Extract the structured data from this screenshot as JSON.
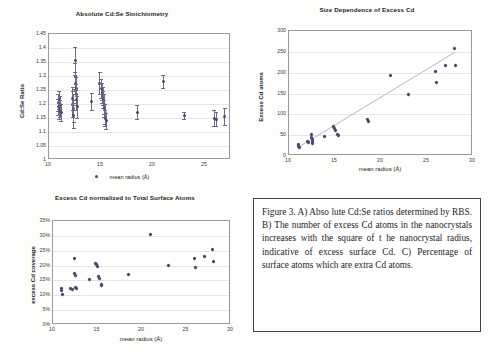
{
  "figure": {
    "caption": "Figure 3.   A) Abso lute Cd:Se ratios determined by RBS. B) The number of excess Cd atoms in the nanocrystals increases with the square of t he nanocrystal radius, indicative of excess surface Cd.  C) Percentage of surface atoms which are extra Cd atoms."
  },
  "chart_data": [
    {
      "id": "panel-a",
      "type": "scatter",
      "title": "Absolute Cd:Se Stoichiometry",
      "xlabel": "mean radius (Å)",
      "ylabel": "Cd:Se Ratio",
      "xlim": [
        10,
        27.5
      ],
      "ylim": [
        1,
        1.45
      ],
      "xticks": [
        10,
        15,
        20,
        25
      ],
      "yticks": [
        "1",
        "1.05",
        "1.1",
        "1.15",
        "1.2",
        "1.25",
        "1.3",
        "1.35",
        "1.4",
        "1.45"
      ],
      "grid": true,
      "legend": "mean radius (Å)",
      "legend_position": "bottom",
      "points": [
        {
          "x": 10.9,
          "y": 1.205,
          "err": 0.03
        },
        {
          "x": 10.9,
          "y": 1.19,
          "err": 0.028
        },
        {
          "x": 11.0,
          "y": 1.175,
          "err": 0.03
        },
        {
          "x": 11.0,
          "y": 1.215,
          "err": 0.032
        },
        {
          "x": 11.1,
          "y": 1.185,
          "err": 0.03
        },
        {
          "x": 11.1,
          "y": 1.2,
          "err": 0.028
        },
        {
          "x": 11.2,
          "y": 1.17,
          "err": 0.03
        },
        {
          "x": 12.3,
          "y": 1.2,
          "err": 0.045
        },
        {
          "x": 12.3,
          "y": 1.22,
          "err": 0.04
        },
        {
          "x": 12.4,
          "y": 1.185,
          "err": 0.05
        },
        {
          "x": 12.4,
          "y": 1.16,
          "err": 0.045
        },
        {
          "x": 12.5,
          "y": 1.355,
          "err": 0.05
        },
        {
          "x": 12.5,
          "y": 1.3,
          "err": 0.045
        },
        {
          "x": 12.5,
          "y": 1.275,
          "err": 0.04
        },
        {
          "x": 12.6,
          "y": 1.255,
          "err": 0.04
        },
        {
          "x": 12.6,
          "y": 1.235,
          "err": 0.038
        },
        {
          "x": 12.6,
          "y": 1.215,
          "err": 0.035
        },
        {
          "x": 12.7,
          "y": 1.19,
          "err": 0.04
        },
        {
          "x": 14.1,
          "y": 1.21,
          "err": 0.03
        },
        {
          "x": 14.9,
          "y": 1.275,
          "err": 0.04
        },
        {
          "x": 15.0,
          "y": 1.255,
          "err": 0.035
        },
        {
          "x": 15.1,
          "y": 1.24,
          "err": 0.035
        },
        {
          "x": 15.1,
          "y": 1.245,
          "err": 0.03
        },
        {
          "x": 15.2,
          "y": 1.23,
          "err": 0.032
        },
        {
          "x": 15.2,
          "y": 1.215,
          "err": 0.03
        },
        {
          "x": 15.3,
          "y": 1.2,
          "err": 0.035
        },
        {
          "x": 15.3,
          "y": 1.185,
          "err": 0.03
        },
        {
          "x": 15.4,
          "y": 1.165,
          "err": 0.035
        },
        {
          "x": 15.4,
          "y": 1.15,
          "err": 0.03
        },
        {
          "x": 15.5,
          "y": 1.14,
          "err": 0.028
        },
        {
          "x": 18.5,
          "y": 1.17,
          "err": 0.025
        },
        {
          "x": 21.0,
          "y": 1.28,
          "err": 0.022
        },
        {
          "x": 23.0,
          "y": 1.16,
          "err": 0.012
        },
        {
          "x": 25.9,
          "y": 1.15,
          "err": 0.028
        },
        {
          "x": 26.1,
          "y": 1.145,
          "err": 0.025
        },
        {
          "x": 26.9,
          "y": 1.155,
          "err": 0.03
        },
        {
          "x": 27.8,
          "y": 1.15,
          "err": 0.032
        }
      ]
    },
    {
      "id": "panel-b",
      "type": "scatter",
      "title": "Size Dependence of Excess Cd",
      "xlabel": "mean radius (Å)",
      "ylabel": "Excess Cd atoms",
      "xlim": [
        10,
        30
      ],
      "ylim": [
        0,
        300
      ],
      "xticks": [
        10,
        15,
        20,
        25,
        30
      ],
      "yticks": [
        0,
        50,
        100,
        150,
        200,
        250,
        300
      ],
      "grid": true,
      "trendline": {
        "x0": 11.0,
        "y0": 22,
        "x1": 28.0,
        "y1": 250
      },
      "points": [
        {
          "x": 11.0,
          "y": 28
        },
        {
          "x": 11.0,
          "y": 22
        },
        {
          "x": 11.1,
          "y": 20
        },
        {
          "x": 12.0,
          "y": 35
        },
        {
          "x": 12.1,
          "y": 32
        },
        {
          "x": 12.4,
          "y": 52
        },
        {
          "x": 12.4,
          "y": 45
        },
        {
          "x": 12.5,
          "y": 40
        },
        {
          "x": 12.5,
          "y": 36
        },
        {
          "x": 12.6,
          "y": 31
        },
        {
          "x": 13.9,
          "y": 48
        },
        {
          "x": 14.8,
          "y": 70
        },
        {
          "x": 14.9,
          "y": 66
        },
        {
          "x": 15.0,
          "y": 62
        },
        {
          "x": 15.3,
          "y": 52
        },
        {
          "x": 15.4,
          "y": 49
        },
        {
          "x": 18.5,
          "y": 88
        },
        {
          "x": 18.6,
          "y": 84
        },
        {
          "x": 21.0,
          "y": 193
        },
        {
          "x": 23.0,
          "y": 148
        },
        {
          "x": 25.9,
          "y": 202
        },
        {
          "x": 26.0,
          "y": 176
        },
        {
          "x": 27.0,
          "y": 218
        },
        {
          "x": 28.0,
          "y": 257
        },
        {
          "x": 28.1,
          "y": 217
        }
      ]
    },
    {
      "id": "panel-c",
      "type": "scatter",
      "title": "Excess Cd normalized to Total Surface Atoms",
      "xlabel": "mean radius (Å)",
      "ylabel": "excess Cd  coverage",
      "xlim": [
        10,
        30
      ],
      "ylim": [
        0,
        35
      ],
      "xticks": [
        10,
        15,
        20,
        25,
        30
      ],
      "yticks": [
        "0%",
        "5%",
        "10%",
        "15%",
        "20%",
        "25%",
        "30%",
        "35%"
      ],
      "grid": true,
      "points": [
        {
          "x": 11.0,
          "y": 12.4
        },
        {
          "x": 11.0,
          "y": 11.6
        },
        {
          "x": 11.1,
          "y": 10.2
        },
        {
          "x": 12.0,
          "y": 12.3
        },
        {
          "x": 12.2,
          "y": 11.9
        },
        {
          "x": 12.4,
          "y": 22.5
        },
        {
          "x": 12.4,
          "y": 17.3
        },
        {
          "x": 12.5,
          "y": 16.6
        },
        {
          "x": 12.5,
          "y": 12.6
        },
        {
          "x": 12.6,
          "y": 12.2
        },
        {
          "x": 14.1,
          "y": 15.2
        },
        {
          "x": 14.8,
          "y": 20.6
        },
        {
          "x": 14.9,
          "y": 20.2
        },
        {
          "x": 15.0,
          "y": 19.6
        },
        {
          "x": 15.1,
          "y": 16.4
        },
        {
          "x": 15.2,
          "y": 15.6
        },
        {
          "x": 15.4,
          "y": 13.6
        },
        {
          "x": 15.5,
          "y": 13.3
        },
        {
          "x": 18.5,
          "y": 17.0
        },
        {
          "x": 21.0,
          "y": 30.4
        },
        {
          "x": 23.0,
          "y": 20.1
        },
        {
          "x": 25.9,
          "y": 22.4
        },
        {
          "x": 26.0,
          "y": 19.4
        },
        {
          "x": 27.0,
          "y": 23.0
        },
        {
          "x": 27.9,
          "y": 25.5
        },
        {
          "x": 28.0,
          "y": 21.5
        }
      ]
    }
  ]
}
